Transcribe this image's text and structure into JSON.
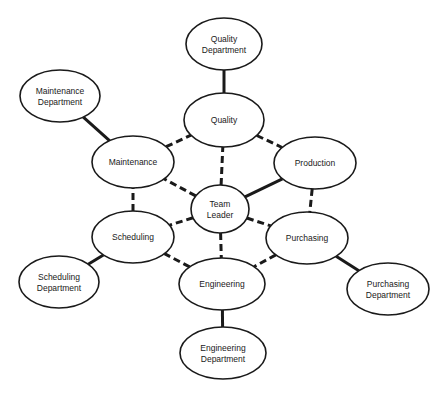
{
  "diagram": {
    "title": "",
    "nodes": [
      {
        "id": "quality_dept",
        "lines": [
          "Quality",
          "Department"
        ],
        "cx": 224,
        "cy": 44,
        "rx": 38,
        "ry": 26
      },
      {
        "id": "quality",
        "lines": [
          "Quality"
        ],
        "cx": 224,
        "cy": 120,
        "rx": 40,
        "ry": 27
      },
      {
        "id": "maintenance_dept",
        "lines": [
          "Maintenance",
          "Department"
        ],
        "cx": 60,
        "cy": 96,
        "rx": 40,
        "ry": 26
      },
      {
        "id": "maintenance",
        "lines": [
          "Maintenance"
        ],
        "cx": 133,
        "cy": 162,
        "rx": 41,
        "ry": 26
      },
      {
        "id": "production",
        "lines": [
          "Production"
        ],
        "cx": 315,
        "cy": 163,
        "rx": 41,
        "ry": 26
      },
      {
        "id": "team_leader",
        "lines": [
          "Team",
          "Leader"
        ],
        "cx": 220,
        "cy": 209,
        "rx": 29,
        "ry": 24
      },
      {
        "id": "scheduling",
        "lines": [
          "Scheduling"
        ],
        "cx": 133,
        "cy": 237,
        "rx": 41,
        "ry": 26
      },
      {
        "id": "scheduling_dept",
        "lines": [
          "Scheduling",
          "Department"
        ],
        "cx": 59,
        "cy": 282,
        "rx": 40,
        "ry": 26
      },
      {
        "id": "purchasing",
        "lines": [
          "Purchasing"
        ],
        "cx": 307,
        "cy": 238,
        "rx": 41,
        "ry": 26
      },
      {
        "id": "purchasing_dept",
        "lines": [
          "Purchasing",
          "Department"
        ],
        "cx": 388,
        "cy": 289,
        "rx": 41,
        "ry": 26
      },
      {
        "id": "engineering",
        "lines": [
          "Engineering"
        ],
        "cx": 222,
        "cy": 284,
        "rx": 43,
        "ry": 26
      },
      {
        "id": "engineering_dept",
        "lines": [
          "Engineering",
          "Department"
        ],
        "cx": 223,
        "cy": 353,
        "rx": 43,
        "ry": 26
      }
    ],
    "edges": [
      {
        "from": "quality",
        "to": "quality_dept",
        "style": "solid"
      },
      {
        "from": "maintenance",
        "to": "maintenance_dept",
        "style": "solid"
      },
      {
        "from": "scheduling",
        "to": "scheduling_dept",
        "style": "solid"
      },
      {
        "from": "purchasing",
        "to": "purchasing_dept",
        "style": "solid"
      },
      {
        "from": "engineering",
        "to": "engineering_dept",
        "style": "solid"
      },
      {
        "from": "team_leader",
        "to": "production",
        "style": "solid"
      },
      {
        "from": "team_leader",
        "to": "quality",
        "style": "dashed"
      },
      {
        "from": "team_leader",
        "to": "maintenance",
        "style": "dashed"
      },
      {
        "from": "team_leader",
        "to": "scheduling",
        "style": "dashed"
      },
      {
        "from": "team_leader",
        "to": "engineering",
        "style": "dashed"
      },
      {
        "from": "team_leader",
        "to": "purchasing",
        "style": "dashed"
      },
      {
        "from": "quality",
        "to": "production",
        "style": "dashed"
      },
      {
        "from": "production",
        "to": "purchasing",
        "style": "dashed"
      },
      {
        "from": "purchasing",
        "to": "engineering",
        "style": "dashed"
      },
      {
        "from": "engineering",
        "to": "scheduling",
        "style": "dashed"
      },
      {
        "from": "scheduling",
        "to": "maintenance",
        "style": "dashed"
      },
      {
        "from": "maintenance",
        "to": "quality",
        "style": "dashed"
      }
    ],
    "colors": {
      "stroke": "#1a1a1a",
      "fill": "#ffffff",
      "background": "#ffffff"
    }
  }
}
